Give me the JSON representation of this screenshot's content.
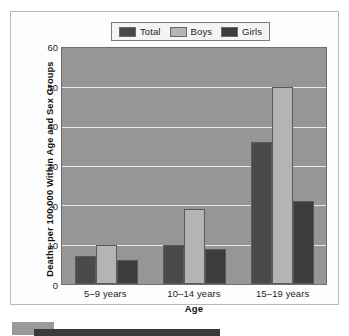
{
  "chart_data": {
    "type": "bar",
    "title": "",
    "categories": [
      "5–9 years",
      "10–14 years",
      "15–19 years"
    ],
    "series": [
      {
        "name": "Total",
        "values": [
          7,
          10,
          36
        ],
        "color": "#4a4a4a"
      },
      {
        "name": "Boys",
        "values": [
          10,
          19,
          50
        ],
        "color": "#b4b4b4"
      },
      {
        "name": "Girls",
        "values": [
          6,
          9,
          21
        ],
        "color": "#3c3c3c"
      }
    ],
    "xlabel": "Age",
    "ylabel": "Deaths per 100,000 Within Age and Sex Groups",
    "ylim": [
      0,
      60
    ],
    "yticks": [
      "0",
      "10",
      "20",
      "30",
      "40",
      "50",
      "60"
    ],
    "grid": true,
    "legend_position": "top-center",
    "plot_background": "#969696",
    "gridline_color": "#e9e9e9"
  },
  "legend": {
    "items": [
      {
        "label": "Total",
        "color": "#4a4a4a"
      },
      {
        "label": "Boys",
        "color": "#b4b4b4"
      },
      {
        "label": "Girls",
        "color": "#3c3c3c"
      }
    ]
  },
  "axes": {
    "y_title": "Deaths per 100,000 Within Age and Sex Groups",
    "x_title": "Age",
    "y_ticks": [
      "60",
      "50",
      "40",
      "30",
      "20",
      "10",
      "0"
    ],
    "x_ticks": [
      "5–9 years",
      "10–14 years",
      "15–19 years"
    ]
  }
}
